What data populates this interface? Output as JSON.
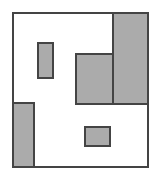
{
  "figure": {
    "canvas": {
      "width": 161,
      "height": 181
    },
    "colors": {
      "background": "#ffffff",
      "shade_fill": "#ababab",
      "stroke": "#444444",
      "unshaded_fill": "#ffffff"
    },
    "stroke_width": 2,
    "outline": {
      "name": "outer-boundary",
      "description": "Large rectangle with a notch cut from the lower-left",
      "points": "13,13 148,13 148,167 34,167 34,103 13,103"
    },
    "shaded_regions": [
      {
        "name": "top-right-shaded-block",
        "shape": "rect",
        "x": 113,
        "y": 13,
        "width": 35,
        "height": 91,
        "fill": "#ababab"
      },
      {
        "name": "center-shaded-block",
        "shape": "rect",
        "x": 76,
        "y": 54,
        "width": 37,
        "height": 50,
        "fill": "#ababab"
      },
      {
        "name": "bottom-left-shaded-strip",
        "shape": "rect",
        "x": 13,
        "y": 103,
        "width": 21,
        "height": 64,
        "fill": "#ababab"
      },
      {
        "name": "upper-left-small-rect",
        "shape": "rect",
        "x": 38,
        "y": 43,
        "width": 15,
        "height": 35,
        "fill": "#ababab"
      },
      {
        "name": "bottom-center-small-rect",
        "shape": "rect",
        "x": 85,
        "y": 127,
        "width": 25,
        "height": 19,
        "fill": "#ababab"
      }
    ],
    "divider_lines": [
      {
        "name": "center-block-right-divider",
        "x1": 113,
        "y1": 54,
        "x2": 113,
        "y2": 104
      },
      {
        "name": "shaded-blocks-bottom-divider",
        "x1": 76,
        "y1": 104,
        "x2": 148,
        "y2": 104
      }
    ],
    "labels": []
  }
}
